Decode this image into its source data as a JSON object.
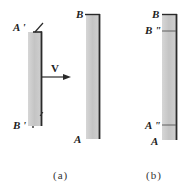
{
  "figure": {
    "panel_a": {
      "caption": "(a)",
      "moving_rod": {
        "top_label": "A '",
        "bottom_label": "B '",
        "velocity_label": "V"
      },
      "stationary_rod": {
        "top_label": "B",
        "bottom_label": "A"
      }
    },
    "panel_b": {
      "caption": "(b)",
      "rod": {
        "top_label": "B",
        "upper_mark_label": "B \"",
        "lower_mark_label": "A \"",
        "bottom_label": "A"
      }
    },
    "colors": {
      "rod_fill": "#c9c9c9",
      "rod_edge": "#2a2a2a",
      "ink": "#222222",
      "background": "#ffffff"
    }
  }
}
